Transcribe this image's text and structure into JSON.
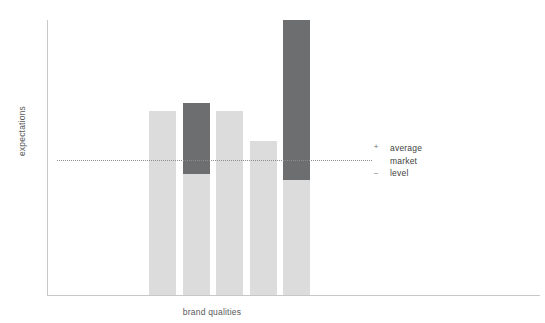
{
  "chart_data": {
    "type": "bar",
    "title": "",
    "subtitle": "",
    "xlabel": "brand qualities",
    "ylabel": "expectations",
    "categories": [
      "1",
      "2",
      "3",
      "4",
      "5"
    ],
    "series": [
      {
        "name": "below average market level",
        "color": "#dcdcdc",
        "values": [
          67,
          44,
          67,
          56,
          42
        ]
      },
      {
        "name": "above average market level",
        "color": "#6d6e70",
        "values": [
          0,
          26,
          0,
          0,
          58
        ]
      }
    ],
    "bars": [
      {
        "index": 1,
        "top_value": 67,
        "light_value": 67,
        "dark_value": 0,
        "has_dark": false
      },
      {
        "index": 2,
        "top_value": 70,
        "light_value": 44,
        "dark_value": 26,
        "has_dark": true
      },
      {
        "index": 3,
        "top_value": 67,
        "light_value": 67,
        "dark_value": 0,
        "has_dark": false
      },
      {
        "index": 4,
        "top_value": 56,
        "light_value": 56,
        "dark_value": 0,
        "has_dark": false
      },
      {
        "index": 5,
        "top_value": 100,
        "light_value": 42,
        "dark_value": 58,
        "has_dark": true
      }
    ],
    "reference_line": {
      "label": "average market level",
      "value": 49,
      "style": "dotted",
      "color": "#8d8d8f"
    },
    "ylim": [
      0,
      100
    ],
    "xlim": [
      0,
      5
    ],
    "grid": false,
    "legend_position": "right",
    "axis_color": "#c8c8c8",
    "background": "#ffffff"
  },
  "axes": {
    "y_title": "expectations",
    "x_title": "brand qualities"
  },
  "legend": {
    "plus_sign": "+",
    "minus_sign": "–",
    "lines": [
      "average",
      "market",
      "level"
    ]
  },
  "colors": {
    "light_bar": "#dcdcdc",
    "dark_bar": "#6d6e70",
    "axis": "#c8c8c8",
    "dotted_line": "#8d8d8f",
    "text": "#3f3f41",
    "axis_text": "#58585a",
    "background": "#ffffff"
  }
}
